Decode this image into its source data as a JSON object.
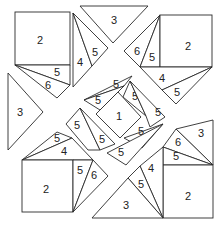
{
  "diagram": {
    "type": "tangram-style puzzle",
    "labels": {
      "tl_square": "2",
      "tl_tri_a": "5",
      "tl_tri_b": "6",
      "top_tri_a": "4",
      "top_tri_b": "5",
      "top_center": "3",
      "tr_tri_a": "6",
      "tr_tri_b": "5",
      "tr_square": "2",
      "tr_bottom_a": "4",
      "tr_bottom_b": "5",
      "left_tri": "3",
      "center_ul": "5",
      "center_ur_a": "5",
      "center_ur_b": "5",
      "center_square": "1",
      "center_l_a": "5",
      "center_l_b": "5",
      "center_lr": "5",
      "center_bottom": "5",
      "bl_tri_a": "5",
      "bl_tri_b": "4",
      "bl_square": "2",
      "bl_side_a": "5",
      "bl_side_b": "6",
      "br_tri": "3",
      "br_side_a": "6",
      "br_side_b": "5",
      "br_square": "2",
      "bc_tri_a": "4",
      "bc_tri_b": "5",
      "bc_big": "3"
    }
  }
}
